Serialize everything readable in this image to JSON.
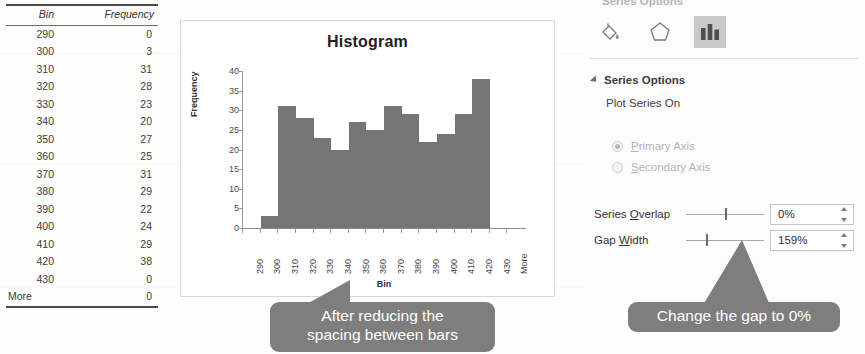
{
  "table": {
    "name": "frequency-table",
    "headers": [
      "Bin",
      "Frequency"
    ],
    "rows": [
      {
        "bin": "290",
        "frequency": "0"
      },
      {
        "bin": "300",
        "frequency": "3"
      },
      {
        "bin": "310",
        "frequency": "31"
      },
      {
        "bin": "320",
        "frequency": "28"
      },
      {
        "bin": "330",
        "frequency": "23"
      },
      {
        "bin": "340",
        "frequency": "20"
      },
      {
        "bin": "350",
        "frequency": "27"
      },
      {
        "bin": "360",
        "frequency": "25"
      },
      {
        "bin": "370",
        "frequency": "31"
      },
      {
        "bin": "380",
        "frequency": "29"
      },
      {
        "bin": "390",
        "frequency": "22"
      },
      {
        "bin": "400",
        "frequency": "24"
      },
      {
        "bin": "410",
        "frequency": "29"
      },
      {
        "bin": "420",
        "frequency": "38"
      },
      {
        "bin": "430",
        "frequency": "0"
      },
      {
        "bin": "More",
        "frequency": "0"
      }
    ]
  },
  "chart_data": {
    "type": "bar",
    "title": "Histogram",
    "xlabel": "Bin",
    "ylabel": "Frequency",
    "categories": [
      "290",
      "300",
      "310",
      "320",
      "330",
      "340",
      "350",
      "360",
      "370",
      "380",
      "390",
      "400",
      "410",
      "420",
      "430",
      "More"
    ],
    "values": [
      0,
      3,
      31,
      28,
      23,
      20,
      27,
      25,
      31,
      29,
      22,
      24,
      29,
      38,
      0,
      0
    ],
    "series": [
      {
        "name": "Frequency",
        "values": [
          0,
          3,
          31,
          28,
          23,
          20,
          27,
          25,
          31,
          29,
          22,
          24,
          29,
          38,
          0,
          0
        ]
      }
    ],
    "yticks": [
      0,
      5,
      10,
      15,
      20,
      25,
      30,
      35,
      40
    ],
    "ylim": [
      0,
      40
    ],
    "grid": false,
    "legend": false,
    "bar_color": "#757575",
    "gap_width_percent": 0,
    "tick_label_rotation": -90
  },
  "format_pane": {
    "header": "Series Options",
    "icons": [
      {
        "name": "fill-bucket-icon",
        "label": "Fill & Line",
        "selected": false
      },
      {
        "name": "effects-pentagon-icon",
        "label": "Effects",
        "selected": false
      },
      {
        "name": "series-options-chart-icon",
        "label": "Series Options",
        "selected": true
      }
    ],
    "section_title": "Series Options",
    "plot_series_on_label": "Plot Series On",
    "radios": [
      {
        "label_before": "P",
        "label_after": "rimary Axis",
        "checked": true,
        "disabled": true
      },
      {
        "label_before": "S",
        "label_after": "econdary Axis",
        "checked": false,
        "disabled": true
      }
    ],
    "series_overlap": {
      "label_before": "Series ",
      "label_mn": "O",
      "label_after": "verlap",
      "value": "0%",
      "slider_position_percent": 50
    },
    "gap_width": {
      "label_before": "Gap ",
      "label_mn": "W",
      "label_after": "idth",
      "value": "159%",
      "slider_position_percent": 26
    }
  },
  "callouts": {
    "left": "After reducing the\nspacing between bars",
    "right": "Change the gap to 0%"
  },
  "colors": {
    "bar": "#757575",
    "callout_bg": "#7e7e7e",
    "callout_text": "#ffffff",
    "pane_selected_icon_bg": "#c9c9c9"
  }
}
